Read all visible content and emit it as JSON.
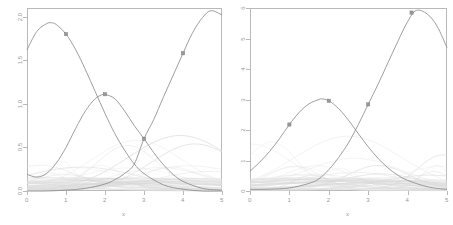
{
  "figure": {
    "width": 453,
    "height": 225,
    "background": "#ffffff",
    "panel_count": 2
  },
  "colors": {
    "axis": "#b9b9b9",
    "tick_text": "#999999",
    "main_curve": "#8c8c8c",
    "faint_curve": "#d8d8d8",
    "very_faint_curve": "#e8e8e8",
    "marker_fill": "#9a9a9a",
    "marker_stroke": "#7c7c7c"
  },
  "chart_data": [
    {
      "id": "left-panel",
      "type": "line",
      "title": "",
      "xlabel": "x",
      "ylabel": "",
      "xlim": [
        0,
        5
      ],
      "ylim": [
        0,
        2.1
      ],
      "grid": false,
      "legend": "none",
      "xticks": [
        0,
        1,
        2,
        3,
        4,
        5
      ],
      "xticklabels": [
        "0",
        "1",
        "2",
        "3",
        "4",
        "5"
      ],
      "yticks": [
        0.0,
        0.5,
        1.0,
        1.5,
        2.0
      ],
      "yticklabels": [
        "0.0",
        "0.5",
        "1.0",
        "1.5",
        "2.0"
      ],
      "series": [
        {
          "name": "curve-1",
          "role": "main",
          "shape": "gaussian-bump",
          "peak_x": 0.62,
          "peak_y": 1.93,
          "width": 1.25,
          "baseline": 0.0,
          "x": [
            0.0,
            0.25,
            0.5,
            0.62,
            0.75,
            1.0,
            1.25,
            1.5,
            1.75,
            2.0,
            2.25,
            2.5,
            2.75,
            3.0,
            3.5,
            4.0,
            4.5,
            5.0
          ],
          "y": [
            1.62,
            1.83,
            1.92,
            1.93,
            1.91,
            1.8,
            1.62,
            1.39,
            1.14,
            0.89,
            0.66,
            0.47,
            0.31,
            0.2,
            0.07,
            0.02,
            0.0,
            0.0
          ]
        },
        {
          "name": "curve-2",
          "role": "main",
          "shape": "gaussian-bump",
          "peak_x": 1.95,
          "peak_y": 1.11,
          "width": 1.0,
          "baseline": 0.0,
          "x": [
            0.0,
            0.25,
            0.5,
            0.75,
            1.0,
            1.25,
            1.5,
            1.75,
            1.95,
            2.0,
            2.25,
            2.5,
            2.75,
            3.0,
            3.25,
            3.5,
            3.75,
            4.0,
            4.5,
            5.0
          ],
          "y": [
            0.19,
            0.16,
            0.2,
            0.32,
            0.5,
            0.72,
            0.92,
            1.06,
            1.11,
            1.11,
            1.06,
            0.92,
            0.75,
            0.6,
            0.44,
            0.3,
            0.19,
            0.11,
            0.03,
            0.01
          ]
        },
        {
          "name": "curve-3",
          "role": "main",
          "shape": "rising-bump",
          "peak_x": 4.72,
          "peak_y": 2.07,
          "baseline": 0.0,
          "x": [
            0.0,
            0.5,
            1.0,
            1.5,
            2.0,
            2.25,
            2.5,
            2.75,
            3.0,
            3.25,
            3.5,
            3.75,
            4.0,
            4.25,
            4.5,
            4.72,
            5.0
          ],
          "y": [
            0.0,
            0.0,
            0.01,
            0.03,
            0.08,
            0.13,
            0.2,
            0.31,
            0.6,
            0.82,
            1.08,
            1.33,
            1.58,
            1.82,
            1.99,
            2.07,
            2.02
          ]
        }
      ],
      "markers": [
        {
          "x": 1.0,
          "y": 1.8,
          "series": "curve-1"
        },
        {
          "x": 2.0,
          "y": 1.11,
          "series": "curve-2"
        },
        {
          "x": 3.0,
          "y": 0.6,
          "series": "curve-2"
        },
        {
          "x": 4.0,
          "y": 1.58,
          "series": "curve-3"
        }
      ],
      "background_curves_count": 28,
      "background_curves_note": "many faint overlapping low-amplitude bump basis functions near baseline"
    },
    {
      "id": "right-panel",
      "type": "line",
      "title": "",
      "xlabel": "x",
      "ylabel": "",
      "xlim": [
        0,
        5
      ],
      "ylim": [
        0,
        6.0
      ],
      "grid": false,
      "legend": "none",
      "xticks": [
        0,
        1,
        2,
        3,
        4,
        5
      ],
      "xticklabels": [
        "0",
        "1",
        "2",
        "3",
        "4",
        "5"
      ],
      "yticks": [
        0,
        1,
        2,
        3,
        4,
        5,
        6
      ],
      "yticklabels": [
        "0",
        "1",
        "2",
        "3",
        "4",
        "5",
        "6"
      ],
      "series": [
        {
          "name": "curve-1",
          "role": "main",
          "shape": "gaussian-bump",
          "peak_x": 1.82,
          "peak_y": 3.02,
          "baseline": 0.0,
          "x": [
            0.0,
            0.25,
            0.5,
            0.75,
            1.0,
            1.25,
            1.5,
            1.75,
            1.82,
            2.0,
            2.25,
            2.5,
            2.75,
            3.0,
            3.25,
            3.5,
            3.75,
            4.0,
            4.5,
            5.0
          ],
          "y": [
            0.65,
            0.95,
            1.3,
            1.72,
            2.18,
            2.58,
            2.86,
            3.0,
            3.02,
            2.96,
            2.7,
            2.32,
            1.88,
            1.45,
            1.07,
            0.76,
            0.52,
            0.35,
            0.14,
            0.05
          ]
        },
        {
          "name": "curve-2",
          "role": "main",
          "shape": "rising-bump",
          "peak_x": 4.22,
          "peak_y": 5.92,
          "baseline": 0.0,
          "x": [
            0.0,
            0.5,
            1.0,
            1.5,
            1.75,
            2.0,
            2.25,
            2.5,
            2.75,
            3.0,
            3.25,
            3.5,
            3.75,
            4.0,
            4.22,
            4.5,
            4.75,
            5.0
          ],
          "y": [
            0.05,
            0.06,
            0.1,
            0.25,
            0.4,
            0.7,
            1.1,
            1.58,
            2.18,
            2.84,
            3.5,
            4.2,
            4.9,
            5.55,
            5.92,
            5.8,
            5.4,
            4.7
          ]
        }
      ],
      "markers": [
        {
          "x": 1.0,
          "y": 2.18,
          "series": "curve-1"
        },
        {
          "x": 2.0,
          "y": 2.96,
          "series": "curve-1"
        },
        {
          "x": 3.0,
          "y": 2.84,
          "series": "curve-2"
        },
        {
          "x": 4.1,
          "y": 5.85,
          "series": "curve-2"
        }
      ],
      "background_curves_count": 26,
      "background_curves_note": "many faint overlapping low-amplitude bump basis functions near baseline"
    }
  ]
}
